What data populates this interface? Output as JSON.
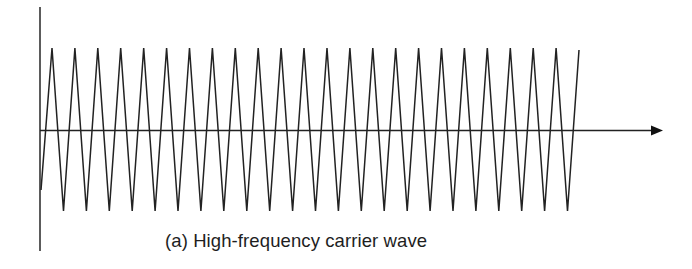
{
  "figure": {
    "caption": "(a) High-frequency carrier wave",
    "stroke_color": "#222222",
    "background": "#ffffff"
  },
  "chart_data": {
    "type": "line",
    "title": "(a) High-frequency carrier wave",
    "xlabel": "",
    "ylabel": "",
    "waveform": "triangle",
    "amplitude_normalized": 1.0,
    "num_peaks": 24,
    "num_troughs": 23,
    "start": {
      "x": 0,
      "y": -0.75
    },
    "period_px": 22.9,
    "axis": {
      "horizontal_arrow": true,
      "vertical_axis": true,
      "ticks": false,
      "grid": false
    },
    "layout_px": {
      "y_axis_x": 40,
      "y_axis_top": 7,
      "y_axis_bottom": 251,
      "x_axis_y": 130,
      "x_axis_start": 40,
      "x_axis_end": 662,
      "peak_y": 48,
      "trough_y": 211,
      "wave_start": [
        41,
        190
      ],
      "first_peak_x": 52,
      "first_trough_x": 64,
      "last_point": [
        579,
        50
      ]
    }
  }
}
